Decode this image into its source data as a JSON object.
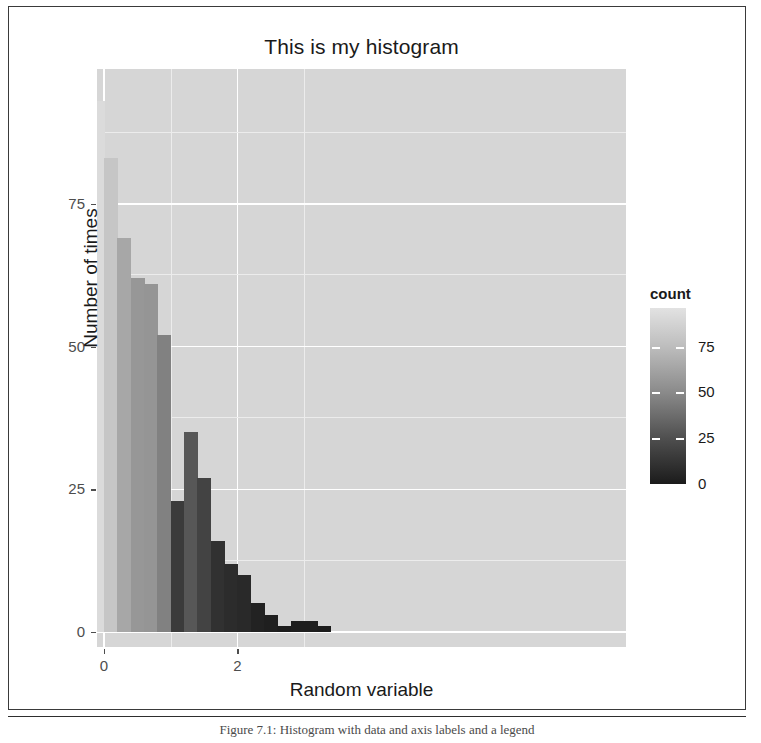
{
  "chart_data": {
    "type": "bar",
    "title": "This is my histogram",
    "xlabel": "Random variable",
    "ylabel": "Number of times",
    "xlim": [
      -3.9,
      3.6
    ],
    "ylim": [
      0,
      96
    ],
    "grid": true,
    "legend_position": "right",
    "xticks": [
      "-4",
      "-2",
      "0",
      "2"
    ],
    "xtick_values": [
      -4,
      -2,
      0,
      2
    ],
    "yticks": [
      "0",
      "25",
      "50",
      "75"
    ],
    "ytick_values": [
      0,
      25,
      50,
      75
    ],
    "bin_width": 0.2,
    "bin_centers": [
      -3.5,
      -3.3,
      -3.1,
      -2.9,
      -2.7,
      -2.5,
      -2.3,
      -2.1,
      -1.9,
      -1.7,
      -1.5,
      -1.3,
      -1.1,
      -0.9,
      -0.7,
      -0.5,
      -0.3,
      -0.1,
      0.1,
      0.3,
      0.5,
      0.7,
      0.9,
      1.1,
      1.3,
      1.5,
      1.7,
      1.9,
      2.1,
      2.3,
      2.5,
      2.7,
      2.9,
      3.1,
      3.3
    ],
    "values": [
      1,
      1,
      5,
      8,
      1,
      0,
      4,
      4,
      19,
      13,
      25,
      60,
      52,
      64,
      85,
      84,
      93,
      93,
      83,
      69,
      62,
      61,
      52,
      23,
      35,
      27,
      16,
      12,
      10,
      5,
      3,
      1,
      2,
      2,
      1
    ],
    "legend": {
      "title": "count",
      "ticks": [
        "75",
        "50",
        "25",
        "0"
      ],
      "tick_values": [
        75,
        50,
        25,
        0
      ],
      "low_color": "#1b1b1b",
      "high_color": "#e2e2e2"
    },
    "colors": {
      "panel_background": "#d6d6d6",
      "gridline_major": "#ffffff",
      "axis_text": "#4d4d4d",
      "title_text": "#1a1a1a"
    }
  },
  "caption": {
    "text": "Figure 7.1: Histogram with data and axis labels and a legend"
  }
}
